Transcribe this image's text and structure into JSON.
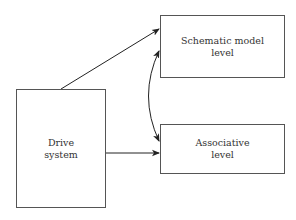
{
  "diagram": {
    "nodes": [
      {
        "id": "drive",
        "label": "Drive\nsystem",
        "x": 16,
        "y": 89,
        "w": 90,
        "h": 119
      },
      {
        "id": "schematic",
        "label": "Schematic model\nlevel",
        "x": 160,
        "y": 15,
        "w": 125,
        "h": 63
      },
      {
        "id": "associative",
        "label": "Associative\nlevel",
        "x": 160,
        "y": 124,
        "w": 125,
        "h": 50
      }
    ],
    "edges": [
      {
        "from": "drive",
        "to": "schematic",
        "type": "directed"
      },
      {
        "from": "drive",
        "to": "associative",
        "type": "directed"
      },
      {
        "from": "schematic",
        "to": "associative",
        "type": "bidirectional-curved"
      }
    ],
    "colors": {
      "stroke": "#555555",
      "arrow": "#222222",
      "text": "#333333"
    }
  }
}
